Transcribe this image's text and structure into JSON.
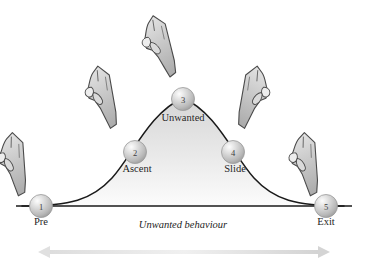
{
  "diagram": {
    "caption": "Unwanted behaviour",
    "baseline_label_left": "Pre",
    "baseline_label_right": "Exit",
    "colors": {
      "curve_stroke": "#1a1a1a",
      "fill_top": "#d8d8d8",
      "fill_bottom": "#fbfbfb",
      "node_fill": "#c9c9c9",
      "node_highlight": "#f2f2f2",
      "node_shadow": "#8f8f8f",
      "hand_fill": "#c6c6c6",
      "hand_stroke": "#4a4a4a",
      "arrow_fill": "#e6e6e6",
      "text": "#1d1d1d"
    },
    "nodes": [
      {
        "number": "1",
        "label": "Pre",
        "cx": 41,
        "cy": 206,
        "label_x": 41,
        "label_y": 223,
        "label_align": "center"
      },
      {
        "number": "2",
        "label": "Ascent",
        "cx": 135,
        "cy": 152,
        "label_x": 137,
        "label_y": 170,
        "label_align": "center"
      },
      {
        "number": "3",
        "label": "Unwanted",
        "cx": 183,
        "cy": 99,
        "label_x": 183,
        "label_y": 119,
        "label_align": "center"
      },
      {
        "number": "4",
        "label": "Slide",
        "cx": 233,
        "cy": 152,
        "label_x": 235,
        "label_y": 170,
        "label_align": "center"
      },
      {
        "number": "5",
        "label": "Exit",
        "cx": 326,
        "cy": 206,
        "label_x": 326,
        "label_y": 223,
        "label_align": "center"
      }
    ],
    "hands": [
      {
        "name": "pointing-hand-pre",
        "x": 8,
        "y": 128,
        "rotate": 28,
        "flip": false
      },
      {
        "name": "pointing-hand-ascent",
        "x": 93,
        "y": 62,
        "rotate": 22,
        "flip": false
      },
      {
        "name": "pointing-hand-unwanted",
        "x": 148,
        "y": 12,
        "rotate": 18,
        "flip": false
      },
      {
        "name": "pointing-hand-slide",
        "x": 218,
        "y": 62,
        "rotate": -22,
        "flip": true
      },
      {
        "name": "pointing-hand-exit",
        "x": 298,
        "y": 128,
        "rotate": 28,
        "flip": false
      }
    ],
    "bottom_arrow": {
      "name": "duration-arrow",
      "x1": 38,
      "x2": 330,
      "y": 252
    }
  }
}
